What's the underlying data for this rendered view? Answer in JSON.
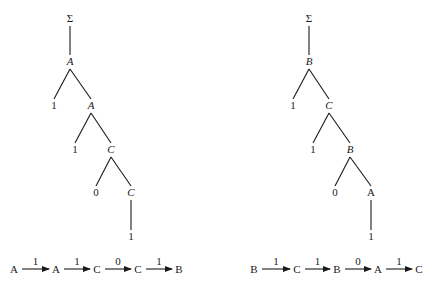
{
  "diagrams": [
    {
      "name": "left-parse-tree",
      "nodes": [
        {
          "id": "root",
          "label": "Σ",
          "italic": false,
          "x": 70,
          "y": 22
        },
        {
          "id": "n1",
          "label": "A",
          "italic": true,
          "x": 70,
          "y": 65
        },
        {
          "id": "n1a",
          "label": "1",
          "italic": false,
          "x": 54,
          "y": 109
        },
        {
          "id": "n2",
          "label": "A",
          "italic": true,
          "x": 91,
          "y": 109
        },
        {
          "id": "n2a",
          "label": "1",
          "italic": false,
          "x": 75,
          "y": 153
        },
        {
          "id": "n3",
          "label": "C",
          "italic": true,
          "x": 111,
          "y": 153
        },
        {
          "id": "n3a",
          "label": "0",
          "italic": false,
          "x": 96,
          "y": 196
        },
        {
          "id": "n4",
          "label": "C",
          "italic": true,
          "x": 131,
          "y": 196
        },
        {
          "id": "n4a",
          "label": "1",
          "italic": false,
          "x": 131,
          "y": 240
        }
      ],
      "edges": [
        [
          "root",
          "n1"
        ],
        [
          "n1",
          "n1a"
        ],
        [
          "n1",
          "n2"
        ],
        [
          "n2",
          "n2a"
        ],
        [
          "n2",
          "n3"
        ],
        [
          "n3",
          "n3a"
        ],
        [
          "n3",
          "n4"
        ],
        [
          "n4",
          "n4a"
        ]
      ],
      "sequence": {
        "states": [
          "A",
          "A",
          "C",
          "C",
          "B"
        ],
        "transitions": [
          "1",
          "1",
          "0",
          "1"
        ]
      }
    },
    {
      "name": "right-parse-tree",
      "nodes": [
        {
          "id": "root",
          "label": "Σ",
          "italic": false,
          "x": 309,
          "y": 22
        },
        {
          "id": "n1",
          "label": "B",
          "italic": true,
          "x": 309,
          "y": 65
        },
        {
          "id": "n1a",
          "label": "1",
          "italic": false,
          "x": 293,
          "y": 109
        },
        {
          "id": "n2",
          "label": "C",
          "italic": true,
          "x": 329,
          "y": 109
        },
        {
          "id": "n2a",
          "label": "1",
          "italic": false,
          "x": 313,
          "y": 153
        },
        {
          "id": "n3",
          "label": "B",
          "italic": true,
          "x": 350,
          "y": 153
        },
        {
          "id": "n3a",
          "label": "0",
          "italic": false,
          "x": 335,
          "y": 196
        },
        {
          "id": "n4",
          "label": "A",
          "italic": false,
          "x": 371,
          "y": 196
        },
        {
          "id": "n4a",
          "label": "1",
          "italic": false,
          "x": 371,
          "y": 240
        }
      ],
      "edges": [
        [
          "root",
          "n1"
        ],
        [
          "n1",
          "n1a"
        ],
        [
          "n1",
          "n2"
        ],
        [
          "n2",
          "n2a"
        ],
        [
          "n2",
          "n3"
        ],
        [
          "n3",
          "n3a"
        ],
        [
          "n3",
          "n4"
        ],
        [
          "n4",
          "n4a"
        ]
      ],
      "sequence": {
        "states": [
          "B",
          "C",
          "B",
          "A",
          "C"
        ],
        "transitions": [
          "1",
          "1",
          "0",
          "1"
        ]
      }
    }
  ],
  "layout": {
    "sequence_y": 273,
    "left_sequence_x": [
      14,
      56,
      97,
      138,
      179
    ],
    "right_sequence_x": [
      254,
      297,
      337,
      378,
      419
    ]
  }
}
